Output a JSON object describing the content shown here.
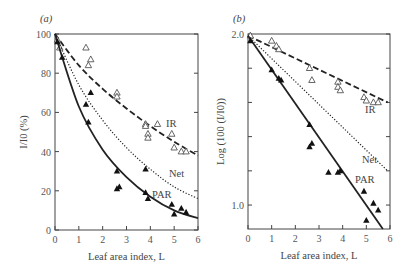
{
  "chart_data": [
    {
      "type": "scatter",
      "panel_label": "(a)",
      "title": "",
      "xlabel": "Leaf area index, L",
      "ylabel": "I/I0 (%)",
      "xlim": [
        0,
        6
      ],
      "ylim": [
        0,
        100
      ],
      "xticks": [
        0,
        1,
        2,
        3,
        4,
        5,
        6
      ],
      "yticks": [
        0,
        20,
        40,
        60,
        80,
        100
      ],
      "grid": false,
      "series": [
        {
          "name": "IR",
          "marker": "open-triangle",
          "line": "dashed",
          "points": [
            [
              0.1,
              97
            ],
            [
              0.2,
              93
            ],
            [
              1.3,
              93
            ],
            [
              1.5,
              87
            ],
            [
              1.4,
              84
            ],
            [
              2.6,
              70
            ],
            [
              2.6,
              68
            ],
            [
              3.8,
              54
            ],
            [
              3.9,
              49
            ],
            [
              3.9,
              47
            ],
            [
              3.8,
              53
            ],
            [
              4.3,
              54
            ],
            [
              4.9,
              49
            ],
            [
              5.0,
              42
            ],
            [
              5.3,
              40
            ],
            [
              5.5,
              40
            ]
          ],
          "curve": [
            [
              0,
              100
            ],
            [
              1,
              84
            ],
            [
              2,
              72
            ],
            [
              3,
              62
            ],
            [
              4,
              53
            ],
            [
              5,
              45
            ],
            [
              6,
              38
            ]
          ]
        },
        {
          "name": "Net",
          "marker": "none",
          "line": "dotted",
          "curve": [
            [
              0,
              100
            ],
            [
              1,
              74
            ],
            [
              2,
              56
            ],
            [
              3,
              42
            ],
            [
              4,
              31
            ],
            [
              5,
              22
            ],
            [
              6,
              16
            ]
          ]
        },
        {
          "name": "PAR",
          "marker": "filled-triangle",
          "line": "solid",
          "points": [
            [
              0.1,
              96
            ],
            [
              0.3,
              88
            ],
            [
              1.5,
              70
            ],
            [
              1.3,
              64
            ],
            [
              1.4,
              55
            ],
            [
              2.6,
              30
            ],
            [
              2.6,
              21
            ],
            [
              2.7,
              22
            ],
            [
              3.8,
              31
            ],
            [
              3.8,
              19
            ],
            [
              3.9,
              16
            ],
            [
              4.9,
              13
            ],
            [
              5.0,
              8
            ],
            [
              5.3,
              11
            ],
            [
              5.5,
              9
            ]
          ],
          "curve": [
            [
              0,
              100
            ],
            [
              1,
              63
            ],
            [
              2,
              41
            ],
            [
              3,
              27
            ],
            [
              4,
              17
            ],
            [
              5,
              10
            ],
            [
              6,
              6
            ]
          ]
        }
      ],
      "annotations": [
        "IR",
        "Net",
        "PAR"
      ]
    },
    {
      "type": "scatter",
      "panel_label": "(b)",
      "title": "",
      "xlabel": "Leaf area index, L",
      "ylabel": "Log (100 (I/I0))",
      "xlim": [
        0,
        6
      ],
      "ylim": [
        0.86,
        2.0
      ],
      "xticks": [
        0,
        1,
        2,
        3,
        4,
        5,
        6
      ],
      "yticks": [
        1.0,
        2.0
      ],
      "grid": false,
      "series": [
        {
          "name": "IR",
          "marker": "open-triangle",
          "line": "dashed",
          "points": [
            [
              0.1,
              1.99
            ],
            [
              1.0,
              1.96
            ],
            [
              1.2,
              1.93
            ],
            [
              1.3,
              1.91
            ],
            [
              2.6,
              1.8
            ],
            [
              2.7,
              1.73
            ],
            [
              3.8,
              1.72
            ],
            [
              3.8,
              1.69
            ],
            [
              3.9,
              1.67
            ],
            [
              4.9,
              1.63
            ],
            [
              5.0,
              1.61
            ],
            [
              5.3,
              1.6
            ],
            [
              5.5,
              1.6
            ]
          ],
          "curve": [
            [
              0,
              1.99
            ],
            [
              5.9,
              1.6
            ]
          ]
        },
        {
          "name": "Net",
          "marker": "none",
          "line": "dotted",
          "curve": [
            [
              0,
              1.99
            ],
            [
              5.9,
              1.2
            ]
          ]
        },
        {
          "name": "PAR",
          "marker": "filled-triangle",
          "line": "solid",
          "points": [
            [
              0.1,
              1.96
            ],
            [
              1.0,
              1.79
            ],
            [
              1.3,
              1.74
            ],
            [
              1.4,
              1.73
            ],
            [
              2.6,
              1.47
            ],
            [
              2.6,
              1.34
            ],
            [
              2.7,
              1.36
            ],
            [
              3.4,
              1.19
            ],
            [
              3.8,
              1.19
            ],
            [
              3.9,
              1.2
            ],
            [
              4.9,
              1.08
            ],
            [
              5.0,
              0.91
            ],
            [
              5.3,
              1.01
            ],
            [
              5.5,
              0.97
            ]
          ],
          "curve": [
            [
              0,
              1.99
            ],
            [
              5.7,
              0.86
            ]
          ]
        }
      ],
      "annotations": [
        "IR",
        "Net",
        "PAR"
      ]
    }
  ]
}
